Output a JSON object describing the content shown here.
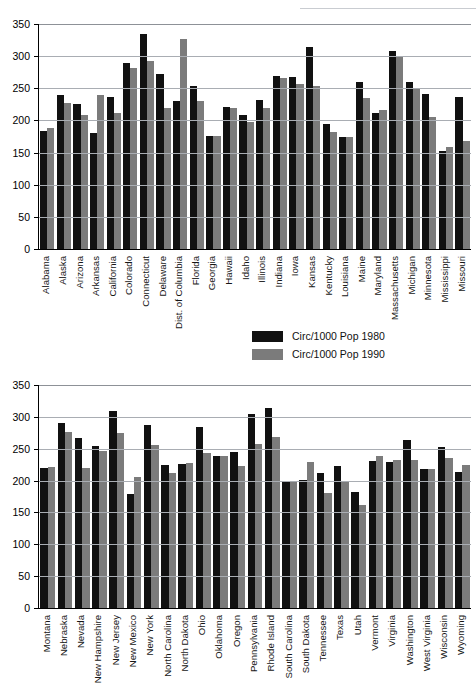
{
  "chart_data": [
    {
      "id": "top",
      "type": "bar",
      "title": "",
      "xlabel": "",
      "ylabel": "",
      "ylim": [
        0,
        350
      ],
      "yticks": [
        0,
        50,
        100,
        150,
        200,
        250,
        300,
        350
      ],
      "grid": true,
      "legend_position": "below-right",
      "series": [
        {
          "name": "Circ/1000 Pop 1980",
          "color": "#111111",
          "values": [
            184,
            239,
            225,
            180,
            237,
            289,
            334,
            272,
            231,
            253,
            176,
            221,
            209,
            232,
            269,
            267,
            315,
            194,
            175,
            260,
            212,
            308,
            260,
            241,
            152,
            236
          ]
        },
        {
          "name": "Circ/1000 Pop 1990",
          "color": "#7b7b7b",
          "values": [
            189,
            227,
            208,
            240,
            212,
            282,
            292,
            219,
            326,
            231,
            176,
            220,
            198,
            219,
            266,
            256,
            253,
            182,
            175,
            235,
            216,
            299,
            251,
            205,
            158,
            168
          ]
        }
      ],
      "categories": [
        "Alabama",
        "Alaska",
        "Arizona",
        "Arkansas",
        "California",
        "Colorado",
        "Connecticut",
        "Delaware",
        "Dist. of Columbia",
        "Florida",
        "Georgia",
        "Hawaii",
        "Idaho",
        "Illinois",
        "Indiana",
        "Iowa",
        "Kansas",
        "Kentucky",
        "Louisiana",
        "Maine",
        "Maryland",
        "Massachusetts",
        "Michigan",
        "Minnesota",
        "Mississippi",
        "Missouri"
      ]
    },
    {
      "id": "bottom",
      "type": "bar",
      "title": "",
      "xlabel": "",
      "ylabel": "",
      "ylim": [
        0,
        350
      ],
      "yticks": [
        0,
        50,
        100,
        150,
        200,
        250,
        300,
        350
      ],
      "grid": true,
      "legend_position": "none",
      "series": [
        {
          "name": "Circ/1000 Pop 1980",
          "color": "#111111",
          "values": [
            219,
            291,
            267,
            255,
            309,
            179,
            288,
            224,
            226,
            284,
            238,
            245,
            305,
            314,
            199,
            201,
            212,
            223,
            182,
            230,
            229,
            264,
            218,
            252,
            214
          ]
        },
        {
          "name": "Circ/1000 Pop 1990",
          "color": "#7b7b7b",
          "values": [
            222,
            277,
            220,
            246,
            274,
            206,
            256,
            212,
            228,
            244,
            238,
            223,
            257,
            269,
            197,
            229,
            181,
            198,
            161,
            238,
            232,
            233,
            218,
            236,
            224
          ]
        }
      ],
      "categories": [
        "Montana",
        "Nebraska",
        "Nevada",
        "New Hampshire",
        "New Jersey",
        "New Mexico",
        "New York",
        "North Carolina",
        "North Dakota",
        "Ohio",
        "Oklahoma",
        "Oregon",
        "Pennsylvania",
        "Rhode Island",
        "South Carolina",
        "South Dakota",
        "Tennessee",
        "Texas",
        "Utah",
        "Vermont",
        "Virginia",
        "Washington",
        "West Virginia",
        "Wisconsin",
        "Wyoming"
      ]
    }
  ],
  "legend": {
    "items": [
      {
        "label": "Circ/1000 Pop 1980",
        "color": "#111111"
      },
      {
        "label": "Circ/1000 Pop 1990",
        "color": "#7b7b7b"
      }
    ]
  }
}
